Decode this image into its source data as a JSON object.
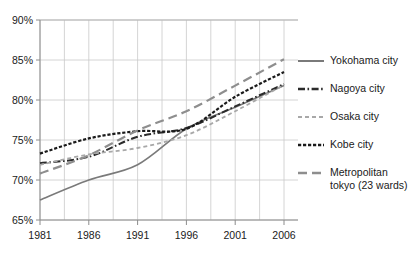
{
  "chart_data": {
    "type": "line",
    "title": "",
    "xlabel": "",
    "ylabel": "",
    "xlim": [
      1981,
      2006
    ],
    "ylim": [
      65,
      90
    ],
    "grid": true,
    "legend_position": "right",
    "x_tick_labels": [
      "1981",
      "1986",
      "1991",
      "1996",
      "2001",
      "2006"
    ],
    "x_tick_values": [
      1981,
      1986,
      1991,
      1996,
      2001,
      2006
    ],
    "y_tick_labels": [
      "65%",
      "70%",
      "75%",
      "80%",
      "85%",
      "90%"
    ],
    "y_tick_values": [
      65,
      70,
      75,
      80,
      85,
      90
    ],
    "x": [
      1981,
      1986,
      1991,
      1996,
      2001,
      2006
    ],
    "series": [
      {
        "name": "Yokohama city",
        "line_style": "solid",
        "color": "#7a7a7a",
        "values": [
          67.5,
          70.0,
          71.9,
          76.4,
          79.1,
          81.8
        ]
      },
      {
        "name": "Nagoya city",
        "line_style": "dash-dot",
        "color": "#2b2b2b",
        "values": [
          72.1,
          72.9,
          75.4,
          76.5,
          79.2,
          82.0
        ]
      },
      {
        "name": "Osaka city",
        "line_style": "short-dash",
        "color": "#a8a8a8",
        "values": [
          71.9,
          73.2,
          74.0,
          75.6,
          78.6,
          81.9
        ]
      },
      {
        "name": "Kobe city",
        "line_style": "dotted-thick",
        "color": "#1a1a1a",
        "values": [
          73.3,
          75.2,
          76.1,
          76.4,
          80.4,
          83.5
        ]
      },
      {
        "name": "Metropolitan tokyo (23 wards)",
        "line_style": "long-dash",
        "color": "#8e8e8e",
        "values": [
          70.8,
          73.1,
          76.2,
          78.6,
          81.8,
          85.1
        ]
      }
    ]
  },
  "legend": {
    "items": [
      {
        "label": "Yokohama city"
      },
      {
        "label": "Nagoya city"
      },
      {
        "label": "Osaka city"
      },
      {
        "label": "Kobe city"
      },
      {
        "label": "Metropolitan\ntokyo (23 wards)"
      }
    ]
  }
}
